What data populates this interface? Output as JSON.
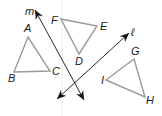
{
  "lines": [
    {
      "name": "m",
      "label": "m",
      "from": [
        84,
        100
      ],
      "to": [
        35,
        10
      ],
      "label_pos": [
        25,
        15
      ]
    },
    {
      "name": "l",
      "label": "ℓ",
      "from": [
        57,
        99
      ],
      "to": [
        129,
        33
      ],
      "label_pos": [
        131,
        36
      ]
    }
  ],
  "triangles": [
    {
      "name": "ABC",
      "vertices": [
        [
          28,
          37
        ],
        [
          14,
          72
        ],
        [
          50,
          71
        ]
      ],
      "labels": [
        {
          "text": "A",
          "pos": [
            24,
            32
          ]
        },
        {
          "text": "B",
          "pos": [
            8,
            82
          ]
        },
        {
          "text": "C",
          "pos": [
            52,
            75
          ]
        }
      ]
    },
    {
      "name": "FED",
      "vertices": [
        [
          61,
          19
        ],
        [
          97,
          26
        ],
        [
          79,
          54
        ]
      ],
      "labels": [
        {
          "text": "F",
          "pos": [
            51,
            24
          ]
        },
        {
          "text": "E",
          "pos": [
            100,
            30
          ]
        },
        {
          "text": "D",
          "pos": [
            75,
            65
          ]
        }
      ]
    },
    {
      "name": "GIH",
      "vertices": [
        [
          134,
          59
        ],
        [
          106,
          80
        ],
        [
          145,
          97
        ]
      ],
      "labels": [
        {
          "text": "G",
          "pos": [
            131,
            55
          ]
        },
        {
          "text": "I",
          "pos": [
            101,
            84
          ]
        },
        {
          "text": "H",
          "pos": [
            146,
            104
          ]
        }
      ]
    }
  ],
  "colors": {
    "triangle_stroke": "#9a9a9a",
    "line_stroke": "#2a2a2a",
    "label": "#1a1a1a",
    "guide_line": "#ececec"
  }
}
